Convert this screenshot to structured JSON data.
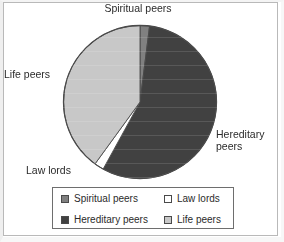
{
  "chart_data": {
    "type": "pie",
    "title": "",
    "categories": [
      "Spiritual peers",
      "Hereditary peers",
      "Law lords",
      "Life peers"
    ],
    "values": [
      2,
      56,
      2,
      40
    ],
    "unit": "percent",
    "legend_position": "bottom",
    "grid": false,
    "slice_colors": [
      "#808080",
      "#414141",
      "#ffffff",
      "#c8c8c8"
    ],
    "start_angle_deg": 0,
    "direction": "clockwise",
    "annotations": [
      {
        "label": "Spiritual peers",
        "position": "top"
      },
      {
        "label": "Life peers",
        "position": "left"
      },
      {
        "label": "Law lords",
        "position": "bottom-left"
      },
      {
        "label": "Hereditary\npeers",
        "position": "right"
      }
    ]
  },
  "labels": {
    "spiritual": "Spiritual peers",
    "life": "Life peers",
    "lawlords": "Law lords",
    "hereditary": "Hereditary\npeers"
  },
  "legend": {
    "items": [
      {
        "label": "Spiritual peers",
        "color": "#808080"
      },
      {
        "label": "Law lords",
        "color": "#ffffff"
      },
      {
        "label": "Hereditary peers",
        "color": "#414141"
      },
      {
        "label": "Life peers",
        "color": "#c8c8c8"
      }
    ]
  },
  "colors": {
    "outline": "#4a4a4a",
    "legend_border": "#6e6e6e",
    "frame_border": "#b9b9b9",
    "text": "#2b2b2b",
    "background": "#ffffff"
  }
}
